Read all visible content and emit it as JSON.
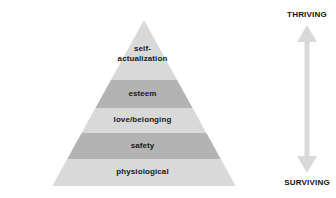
{
  "diagram": {
    "type": "pyramid",
    "colors": {
      "tier_light": "#d9d9d9",
      "tier_dark": "#b3b3b3",
      "arrow": "#d9d9d9",
      "text": "#1a1a1a",
      "background": "#ffffff"
    },
    "tiers": [
      {
        "label": "self-\nactualization",
        "level": 5,
        "shade": "light"
      },
      {
        "label": "esteem",
        "level": 4,
        "shade": "dark"
      },
      {
        "label": "love/belonging",
        "level": 3,
        "shade": "light"
      },
      {
        "label": "safety",
        "level": 2,
        "shade": "dark"
      },
      {
        "label": "physiological",
        "level": 1,
        "shade": "light"
      }
    ]
  },
  "axis": {
    "top_label": "THRIVING",
    "bottom_label": "SURVIVING",
    "arrow_icon": "double-headed-vertical-arrow"
  }
}
